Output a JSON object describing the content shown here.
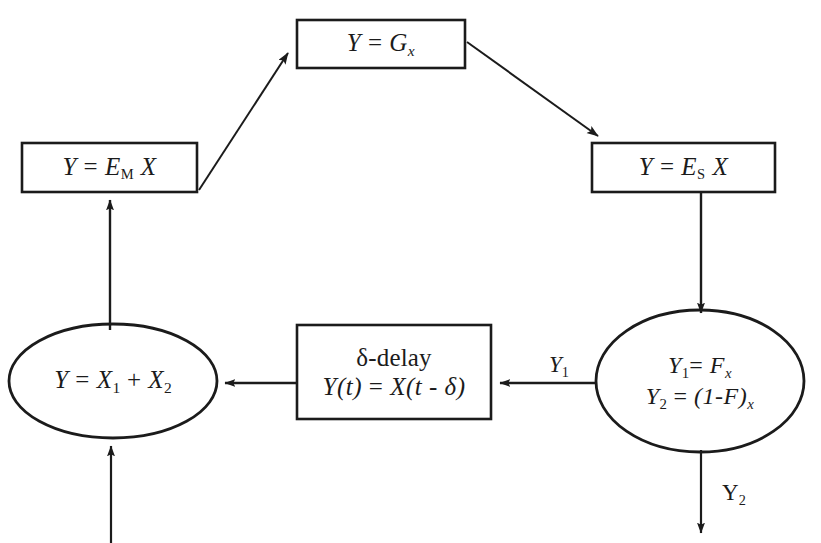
{
  "diagram": {
    "ink_color": "#1b1b1b",
    "background": "#ffffff",
    "nodes": [
      {
        "id": "g-box",
        "shape": "rectangle",
        "name": "gain-box",
        "equation_plain": "Y = G x",
        "lhs": "Y",
        "operator": "=",
        "rhs_base": "G",
        "rhs_sub": "x"
      },
      {
        "id": "em-box",
        "shape": "rectangle",
        "name": "e-m-box",
        "equation_plain": "Y = E M X",
        "lhs": "Y",
        "operator": "=",
        "rhs_base": "E",
        "rhs_sub": "M",
        "rhs_tail": "X"
      },
      {
        "id": "es-box",
        "shape": "rectangle",
        "name": "e-s-box",
        "equation_plain": "Y = E S X",
        "lhs": "Y",
        "operator": "=",
        "rhs_base": "E",
        "rhs_sub": "S",
        "rhs_tail": "X"
      },
      {
        "id": "sum-ellipse",
        "shape": "ellipse",
        "name": "summation-node",
        "equation_plain": "Y = X1 + X2",
        "lhs": "Y",
        "operator": "=",
        "term1_base": "X",
        "term1_sub": "1",
        "plus": "+",
        "term2_base": "X",
        "term2_sub": "2"
      },
      {
        "id": "delay-box",
        "shape": "rectangle",
        "name": "delta-delay-box",
        "line1": "δ-delay",
        "line2_plain": "Y(t) = X(t - δ)",
        "line2_lhs": "Y(t)",
        "line2_op": "=",
        "line2_rhs": "X(t - δ)"
      },
      {
        "id": "split-ellipse",
        "shape": "ellipse",
        "name": "split-node",
        "line1_plain": "Y1 = F x",
        "line1_lhs_base": "Y",
        "line1_lhs_sub": "1",
        "line1_op": "=",
        "line1_rhs_base": "F",
        "line1_rhs_sub": "x",
        "line2_plain": "Y2 = (1-F) x",
        "line2_lhs_base": "Y",
        "line2_lhs_sub": "2",
        "line2_op": "=",
        "line2_rhs_base": "(1-F)",
        "line2_rhs_sub": "x"
      }
    ],
    "edge_labels": [
      {
        "id": "y1-label",
        "name": "edge-label-y1",
        "base": "Y",
        "sub": "1",
        "plain": "Y1"
      },
      {
        "id": "y2-label",
        "name": "edge-label-y2",
        "base": "Y",
        "sub": "2",
        "plain": "Y2"
      }
    ],
    "edges": [
      {
        "name": "edge-em-to-g",
        "from": "em-box",
        "to": "g-box",
        "style": "diagonal-up-right",
        "arrowhead": "end"
      },
      {
        "name": "edge-g-to-es",
        "from": "g-box",
        "to": "es-box",
        "style": "diagonal-down-right",
        "arrowhead": "end"
      },
      {
        "name": "edge-es-to-split",
        "from": "es-box",
        "to": "split-ellipse",
        "style": "vertical-down",
        "arrowhead": "end"
      },
      {
        "name": "edge-split-to-delay",
        "from": "split-ellipse",
        "to": "delay-box",
        "style": "horizontal-left",
        "arrowhead": "end"
      },
      {
        "name": "edge-delay-to-sum",
        "from": "delay-box",
        "to": "sum-ellipse",
        "style": "horizontal-left",
        "arrowhead": "end"
      },
      {
        "name": "edge-sum-to-em",
        "from": "sum-ellipse",
        "to": "em-box",
        "style": "vertical-up",
        "arrowhead": "end"
      },
      {
        "name": "edge-external-input",
        "from": "external",
        "to": "sum-ellipse",
        "style": "vertical-up",
        "arrowhead": "end"
      },
      {
        "name": "edge-split-output",
        "from": "split-ellipse",
        "to": "external",
        "style": "vertical-down",
        "arrowhead": "end"
      }
    ]
  }
}
